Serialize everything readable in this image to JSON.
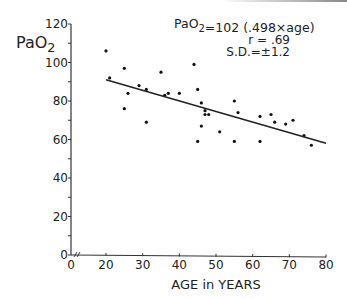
{
  "chart_data": {
    "type": "scatter",
    "title": "",
    "equation": "PaO2=102 (.498×age)",
    "annotations": [
      "PaO2=102 (.498×age)",
      "r = .69",
      "S.D.=±1.2"
    ],
    "xlabel": "AGE in YEARS",
    "ylabel": "PaO2",
    "xlim": [
      0,
      80
    ],
    "ylim": [
      0,
      120
    ],
    "x_ticks": [
      "0",
      "20",
      "30",
      "40",
      "50",
      "60",
      "70",
      "80"
    ],
    "y_ticks": [
      "0",
      "20",
      "40",
      "60",
      "80",
      "100",
      "120"
    ],
    "grid": false,
    "axis_break": true,
    "regression_line": {
      "x": [
        20,
        80
      ],
      "y": [
        91,
        58
      ]
    },
    "points": [
      {
        "x": 20,
        "y": 106
      },
      {
        "x": 21,
        "y": 92
      },
      {
        "x": 25,
        "y": 97
      },
      {
        "x": 26,
        "y": 84
      },
      {
        "x": 25,
        "y": 76
      },
      {
        "x": 29,
        "y": 88
      },
      {
        "x": 31,
        "y": 86
      },
      {
        "x": 31,
        "y": 69
      },
      {
        "x": 35,
        "y": 95
      },
      {
        "x": 36,
        "y": 83
      },
      {
        "x": 37,
        "y": 84
      },
      {
        "x": 40,
        "y": 84
      },
      {
        "x": 44,
        "y": 99
      },
      {
        "x": 45,
        "y": 86
      },
      {
        "x": 46,
        "y": 79
      },
      {
        "x": 47,
        "y": 75
      },
      {
        "x": 47,
        "y": 73
      },
      {
        "x": 48,
        "y": 73
      },
      {
        "x": 46,
        "y": 67
      },
      {
        "x": 45,
        "y": 59
      },
      {
        "x": 51,
        "y": 64
      },
      {
        "x": 55,
        "y": 80
      },
      {
        "x": 56,
        "y": 74
      },
      {
        "x": 55,
        "y": 59
      },
      {
        "x": 62,
        "y": 72
      },
      {
        "x": 65,
        "y": 73
      },
      {
        "x": 62,
        "y": 59
      },
      {
        "x": 66,
        "y": 69
      },
      {
        "x": 69,
        "y": 68
      },
      {
        "x": 71,
        "y": 70
      },
      {
        "x": 74,
        "y": 62
      },
      {
        "x": 76,
        "y": 57
      }
    ]
  }
}
